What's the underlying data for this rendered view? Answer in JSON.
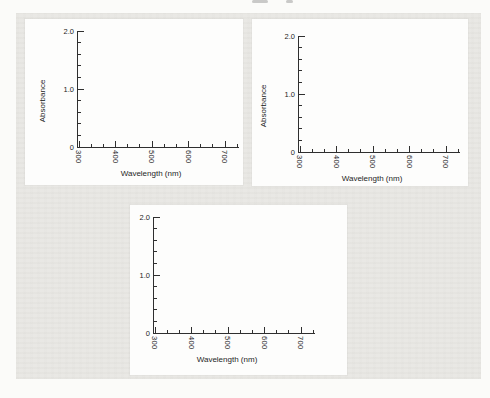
{
  "colors": {
    "scan_background": "#e9e8e4",
    "panel_background": "#fdfdfc",
    "page_background": "#fbfbf9",
    "axis_line": "#2f2f2f",
    "axis_text": "#1e1e1e"
  },
  "figure": {
    "panel_count": 3,
    "ylabel": "Absorbance",
    "xlabel": "Wavelength (nm)"
  },
  "chart_data": [
    {
      "type": "line",
      "title": "",
      "xlabel": "Wavelength (nm)",
      "ylabel": "Absorbance",
      "xlim": [
        300,
        745
      ],
      "ylim": [
        0,
        2.0
      ],
      "x_ticks": [
        300,
        400,
        500,
        600,
        700
      ],
      "x_tick_labels": [
        "300",
        "400",
        "500",
        "600",
        "700"
      ],
      "y_ticks": [
        0,
        1.0,
        2.0
      ],
      "y_tick_labels": [
        "0",
        "1.0",
        "2.0"
      ],
      "x_minor_per_major": 2,
      "y_minor_per_major": 4,
      "x_tick_label_rotation_deg": 90,
      "grid": false,
      "legend": null,
      "series": []
    },
    {
      "type": "line",
      "title": "",
      "xlabel": "Wavelength (nm)",
      "ylabel": "Absorbance",
      "xlim": [
        300,
        745
      ],
      "ylim": [
        0,
        2.0
      ],
      "x_ticks": [
        300,
        400,
        500,
        600,
        700
      ],
      "x_tick_labels": [
        "300",
        "400",
        "500",
        "600",
        "700"
      ],
      "y_ticks": [
        0,
        1.0,
        2.0
      ],
      "y_tick_labels": [
        "0",
        "1.0",
        "2.0"
      ],
      "x_minor_per_major": 2,
      "y_minor_per_major": 4,
      "x_tick_label_rotation_deg": 90,
      "grid": false,
      "legend": null,
      "series": []
    },
    {
      "type": "line",
      "title": "",
      "xlabel": "Wavelength (nm)",
      "ylabel": "Absorbance",
      "xlim": [
        300,
        745
      ],
      "ylim": [
        0,
        2.0
      ],
      "x_ticks": [
        300,
        400,
        500,
        600,
        700
      ],
      "x_tick_labels": [
        "300",
        "400",
        "500",
        "600",
        "700"
      ],
      "y_ticks": [
        0,
        1.0,
        2.0
      ],
      "y_tick_labels": [
        "0",
        "1.0",
        "2.0"
      ],
      "x_minor_per_major": 2,
      "y_minor_per_major": 4,
      "x_tick_label_rotation_deg": 90,
      "grid": false,
      "legend": null,
      "series": []
    }
  ]
}
